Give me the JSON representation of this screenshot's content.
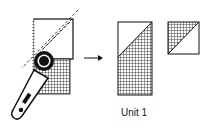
{
  "diagram": {
    "type": "quilting-instruction",
    "steps": [
      {
        "description": "rotary cutter cutting a pieced rectangle diagonally along a ruler line"
      },
      {
        "description": "resulting pieces"
      }
    ],
    "caption": "Unit 1",
    "colors": {
      "line": "#111111",
      "fabric": "#555555",
      "background": "#ffffff"
    }
  }
}
